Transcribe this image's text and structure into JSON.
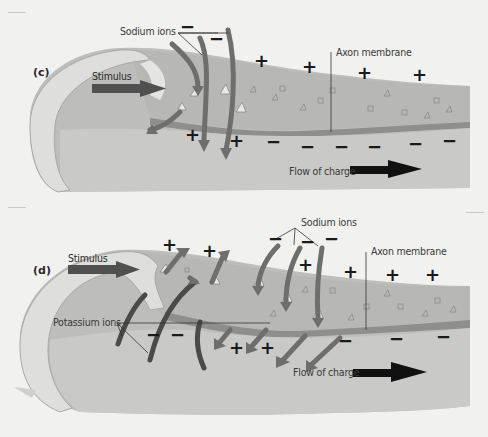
{
  "figure": {
    "panels": [
      {
        "id": "c",
        "letter": "(c)",
        "labels": {
          "sodium_ions": "Sodium ions",
          "stimulus": "Stimulus",
          "axon_membrane": "Axon membrane",
          "flow_of_charge": "Flow of charge"
        },
        "signs": {
          "outside_plus_count": 4,
          "inside_plus_count": 2,
          "inside_minus_count": 6,
          "label_minus_count": 2,
          "plus": "+",
          "minus": "−"
        }
      },
      {
        "id": "d",
        "letter": "(d)",
        "labels": {
          "stimulus": "Stimulus",
          "sodium_ions": "Sodium ions",
          "potassium_ions": "Potassium ions",
          "axon_membrane": "Axon membrane",
          "flow_of_charge": "Flow of charge"
        },
        "signs": {
          "outside_plus_count": 6,
          "inside_plus_count": 3,
          "inside_minus_count": 5,
          "label_minus_count": 3,
          "plus": "+",
          "minus": "−"
        }
      }
    ],
    "colors": {
      "background": "#f1f1f0",
      "axon_outer": "#bdbdbb",
      "axon_interior": "#cfcfcd",
      "membrane_band": "#8e8e8c",
      "myelin_cap": "#dededc",
      "ion_arrow": "#6e6e6c",
      "potassium_arc": "#4a4a48",
      "stimulus_arrow": "#505050",
      "flow_arrow": "#111111",
      "text": "#3a3a3a"
    }
  }
}
